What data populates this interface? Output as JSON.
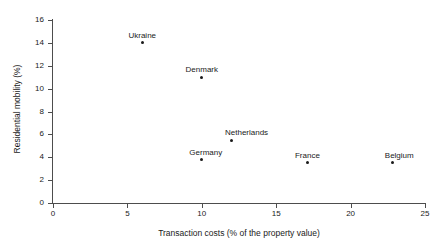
{
  "chart_data": {
    "type": "scatter",
    "title": "",
    "xlabel": "Transaction costs (% of the property value)",
    "ylabel": "Residential mobility (%)",
    "xlim": [
      0,
      25
    ],
    "ylim": [
      0,
      16
    ],
    "xticks": [
      "0",
      "5",
      "10",
      "15",
      "20",
      "25"
    ],
    "xtick_values": [
      0,
      5,
      10,
      15,
      20,
      25
    ],
    "yticks": [
      "0",
      "2",
      "4",
      "6",
      "8",
      "10",
      "12",
      "14",
      "16"
    ],
    "ytick_values": [
      0,
      2,
      4,
      6,
      8,
      10,
      12,
      14,
      16
    ],
    "grid": false,
    "legend": "none",
    "marker_color": "#1a1a1a",
    "axis_color": "#4d4d4d",
    "points": [
      {
        "label": "Ukraine",
        "x": 6.0,
        "y": 14.0,
        "label_dx": 0,
        "label_dy": -11
      },
      {
        "label": "Denmark",
        "x": 10.0,
        "y": 11.0,
        "label_dx": 0,
        "label_dy": -11
      },
      {
        "label": "Netherlands",
        "x": 12.0,
        "y": 5.5,
        "label_dx": 15,
        "label_dy": -11
      },
      {
        "label": "Germany",
        "x": 10.0,
        "y": 3.8,
        "label_dx": 4,
        "label_dy": -11
      },
      {
        "label": "France",
        "x": 17.1,
        "y": 3.5,
        "label_dx": 0,
        "label_dy": -11
      },
      {
        "label": "Belgium",
        "x": 22.8,
        "y": 3.5,
        "label_dx": 7,
        "label_dy": -11
      }
    ]
  }
}
